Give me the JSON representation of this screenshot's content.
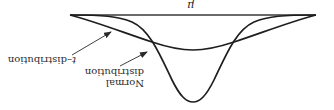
{
  "figure": {
    "orientation": "rotated-180",
    "axis_label": "μ",
    "labels": {
      "t_prefix": "t",
      "t_suffix": "–distribution",
      "normal_line1": "Normal",
      "normal_line2": "distribution"
    },
    "colors": {
      "curve": "#1e1e1e",
      "text": "#2a2a2a",
      "background": "#ffffff"
    },
    "curves": [
      {
        "name": "Normal distribution",
        "shape": "tall narrow bell"
      },
      {
        "name": "t-distribution",
        "shape": "flatter bell with heavier tails"
      }
    ]
  }
}
